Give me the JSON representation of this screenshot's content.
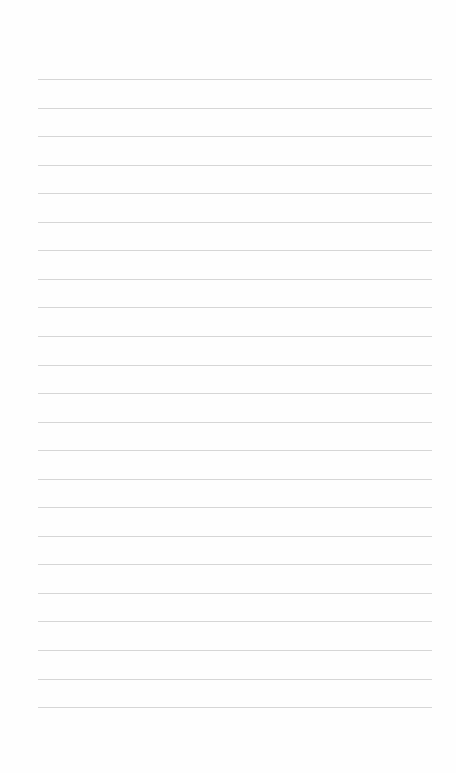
{
  "page": {
    "type": "lined-paper",
    "background": "#fefefe",
    "rule_color": "#d6d6d6",
    "rule_count": 23,
    "rule_start_y": 79,
    "rule_spacing": 28.55,
    "rule_left": 38,
    "rule_width": 394
  }
}
